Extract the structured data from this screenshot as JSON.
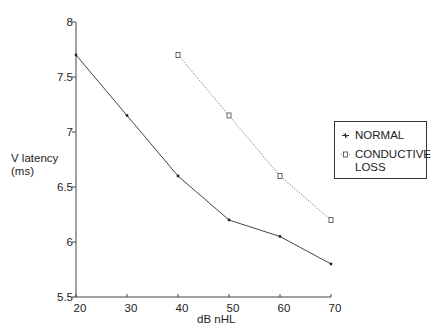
{
  "chart_data": {
    "type": "line",
    "title": "",
    "xlabel": "dB nHL",
    "ylabel": "V latency\n(ms)",
    "x": [
      20,
      30,
      40,
      50,
      60,
      70
    ],
    "xticks": [
      "20",
      "30",
      "40",
      "50",
      "60",
      "70"
    ],
    "yticks": [
      "5.5",
      "6",
      "6.5",
      "7",
      "7.5",
      "8"
    ],
    "xlim": [
      20,
      70
    ],
    "ylim": [
      5.5,
      8
    ],
    "grid": false,
    "legend_position": "right",
    "series": [
      {
        "name": "NORMAL",
        "marker": "star",
        "line_style": "solid",
        "x": [
          20,
          30,
          40,
          50,
          60,
          70
        ],
        "values": [
          7.7,
          7.15,
          6.6,
          6.2,
          6.05,
          5.8
        ]
      },
      {
        "name": "CONDUCTIVE LOSS",
        "marker": "square",
        "line_style": "dotted",
        "x": [
          40,
          50,
          60,
          70
        ],
        "values": [
          7.7,
          7.15,
          6.6,
          6.2
        ]
      }
    ]
  },
  "labels": {
    "ylabel_line1": "V latency",
    "ylabel_line2": "(ms)",
    "xlabel": "dB nHL",
    "legend_normal": "NORMAL",
    "legend_conductive": "CONDUCTIVE\nLOSS"
  }
}
